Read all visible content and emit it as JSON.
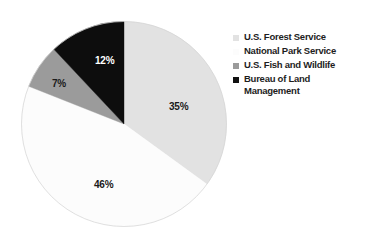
{
  "chart_data": {
    "type": "pie",
    "title": "",
    "subtitle": "",
    "xlabel": "",
    "ylabel": "",
    "grid": false,
    "legend_position": "right",
    "start_angle_deg": 0,
    "direction": "clockwise",
    "categories": [
      "U.S. Forest Service",
      "National Park Service",
      "U.S. Fish and Wildlife",
      "Bureau of Land Management"
    ],
    "values": [
      35,
      46,
      7,
      12
    ],
    "value_labels": [
      "35%",
      "46%",
      "7%",
      "12%"
    ],
    "colors": [
      "#e2e2e2",
      "#fcfcfc",
      "#9b9b9b",
      "#0d0d0d"
    ],
    "label_text_colors": [
      "#1a1a1a",
      "#1a1a1a",
      "#1a1a1a",
      "#ffffff"
    ],
    "slices": [
      {
        "label": "U.S. Forest Service",
        "value": 35,
        "value_label": "35%",
        "color": "#e2e2e2"
      },
      {
        "label": "National Park Service",
        "value": 46,
        "value_label": "46%",
        "color": "#fcfcfc"
      },
      {
        "label": "U.S. Fish and Wildlife",
        "value": 7,
        "value_label": "7%",
        "color": "#9b9b9b"
      },
      {
        "label": "Bureau of Land Management",
        "value": 12,
        "value_label": "12%",
        "color": "#0d0d0d"
      }
    ]
  },
  "legend": {
    "items": [
      {
        "label": "U.S. Forest Service",
        "color": "#e2e2e2",
        "border": "#e2e2e2"
      },
      {
        "label": "National Park Service",
        "color": "#fcfcfc",
        "border": "#fcfcfc"
      },
      {
        "label": "U.S. Fish and Wildlife",
        "color": "#9b9b9b",
        "border": "#9b9b9b"
      },
      {
        "label": "Bureau of Land\nManagement",
        "color": "#111111",
        "border": "#111111"
      }
    ]
  },
  "figure": {
    "background": "#ffffff",
    "outline_color": "#d2d2d2"
  }
}
